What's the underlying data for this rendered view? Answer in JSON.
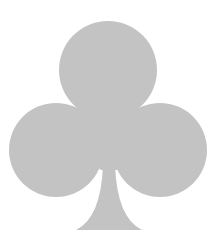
{
  "image": {
    "subject": "club-suit-symbol",
    "background": "#ffffff",
    "fill_color": "#c3c3c3",
    "shape": {
      "top_lobe": {
        "cx": 108,
        "cy": 70,
        "r": 49
      },
      "left_lobe": {
        "cx": 56,
        "cy": 150,
        "r": 47
      },
      "right_lobe": {
        "cx": 160,
        "cy": 150,
        "r": 47
      },
      "stem": {
        "top_y": 165,
        "base_y": 230,
        "base_left_x": 76,
        "base_right_x": 142
      }
    }
  }
}
